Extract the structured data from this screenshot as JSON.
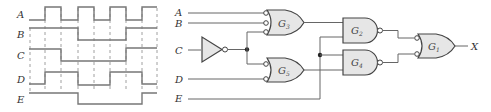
{
  "timing_diagram": {
    "signals": [
      {
        "name": "A",
        "levels": [
          0,
          1,
          0,
          1,
          0,
          1,
          0,
          1
        ]
      },
      {
        "name": "B",
        "levels": [
          1,
          1,
          1,
          0,
          0,
          0,
          1,
          1
        ]
      },
      {
        "name": "C",
        "levels": [
          1,
          1,
          0,
          0,
          0,
          0,
          1,
          1
        ]
      },
      {
        "name": "D",
        "levels": [
          0,
          1,
          1,
          0,
          0,
          1,
          1,
          0
        ]
      },
      {
        "name": "E",
        "levels": [
          1,
          1,
          1,
          0,
          0,
          0,
          0,
          1
        ]
      }
    ],
    "intervals": 8
  },
  "circuit": {
    "inputs": [
      "A",
      "B",
      "C",
      "D",
      "E"
    ],
    "output": "X",
    "gates": [
      {
        "id": "G3",
        "label": "G",
        "sub": "3",
        "type": "OR with inverted inputs",
        "inputs": [
          "A",
          "B",
          "C'"
        ]
      },
      {
        "id": "G5",
        "label": "G",
        "sub": "5",
        "type": "OR with inverted inputs",
        "inputs": [
          "C'",
          "D"
        ]
      },
      {
        "id": "G2",
        "label": "G",
        "sub": "2",
        "type": "NAND",
        "inputs": [
          "G3",
          "E"
        ]
      },
      {
        "id": "G4",
        "label": "G",
        "sub": "4",
        "type": "NAND",
        "inputs": [
          "E",
          "G5"
        ]
      },
      {
        "id": "G1",
        "label": "G",
        "sub": "1",
        "type": "OR with inverted inputs",
        "inputs": [
          "G2",
          "G4"
        ]
      }
    ],
    "inverter": {
      "input": "C"
    }
  }
}
